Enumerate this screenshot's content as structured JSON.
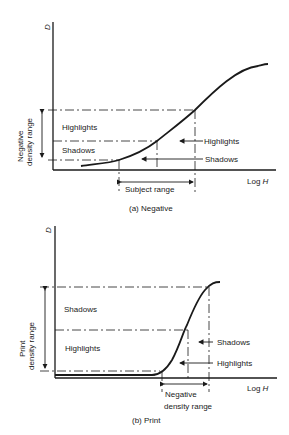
{
  "panel_a": {
    "y_axis_label": "D",
    "x_axis_label_prefix": "Log ",
    "x_axis_label_var": "H",
    "range_label_line1": "Negative",
    "range_label_line2": "density range",
    "region_upper": "Highlights",
    "region_lower": "Shadows",
    "arrow_label_upper": "Highlights",
    "arrow_label_lower": "Shadows",
    "subject_range": "Subject range",
    "caption": "(a) Negative"
  },
  "panel_b": {
    "y_axis_label": "D",
    "x_axis_label_prefix": "Log ",
    "x_axis_label_var": "H",
    "range_label_line1": "Print",
    "range_label_line2": "density range",
    "region_upper": "Shadows",
    "region_lower": "Highlights",
    "arrow_label_upper": "Shadows",
    "arrow_label_lower": "Highlights",
    "neg_range_line1": "Negative",
    "neg_range_line2": "density range",
    "caption": "(b) Print"
  }
}
